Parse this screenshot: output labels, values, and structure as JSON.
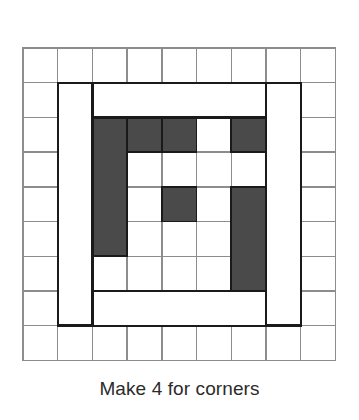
{
  "figure": {
    "caption": "Make 4 for corners"
  },
  "colors": {
    "dark_fabric": "#4a4a4a",
    "light_fabric": "#ffffff",
    "grid_line": "#8d8d8d",
    "outline": "#1a1a1a",
    "background": "#ffffff",
    "caption_text": "#2b2b2b"
  },
  "grid": {
    "columns": 9,
    "rows": 9,
    "cell_size": 34.7,
    "origin_x": 23,
    "origin_y": 48,
    "line_width": 1.4
  },
  "chart_data": {
    "type": "heatmap",
    "xlabel": "",
    "ylabel": "",
    "categories": [
      "c0",
      "c1",
      "c2",
      "c3",
      "c4",
      "c5",
      "c6",
      "c7",
      "c8"
    ],
    "row_labels": [
      "r0",
      "r1",
      "r2",
      "r3",
      "r4",
      "r5",
      "r6",
      "r7",
      "r8"
    ],
    "legend": [
      {
        "name": "dark fabric",
        "color": "#4a4a4a"
      },
      {
        "name": "light fabric",
        "color": "#ffffff"
      }
    ],
    "values": [
      [
        0,
        0,
        0,
        0,
        0,
        0,
        0,
        0,
        0
      ],
      [
        0,
        0,
        0,
        0,
        0,
        0,
        0,
        0,
        0
      ],
      [
        0,
        0,
        1,
        1,
        1,
        0,
        1,
        0,
        0
      ],
      [
        0,
        0,
        1,
        0,
        0,
        0,
        0,
        0,
        0
      ],
      [
        0,
        0,
        1,
        0,
        1,
        0,
        1,
        0,
        0
      ],
      [
        0,
        0,
        1,
        0,
        0,
        0,
        1,
        0,
        0
      ],
      [
        0,
        0,
        0,
        0,
        0,
        0,
        1,
        0,
        0
      ],
      [
        0,
        0,
        1,
        0,
        1,
        1,
        1,
        0,
        0
      ],
      [
        0,
        0,
        0,
        0,
        0,
        0,
        0,
        0,
        0
      ]
    ]
  },
  "patches": {
    "dark_cells": [
      {
        "col": 2,
        "row": 2,
        "w": 1,
        "h": 4
      },
      {
        "col": 3,
        "row": 2,
        "w": 1,
        "h": 1
      },
      {
        "col": 4,
        "row": 2,
        "w": 1,
        "h": 1
      },
      {
        "col": 6,
        "row": 2,
        "w": 1,
        "h": 1
      },
      {
        "col": 4,
        "row": 4,
        "w": 1,
        "h": 1
      },
      {
        "col": 6,
        "row": 4,
        "w": 1,
        "h": 4
      },
      {
        "col": 2,
        "row": 7,
        "w": 1,
        "h": 1
      },
      {
        "col": 4,
        "row": 7,
        "w": 1,
        "h": 1
      },
      {
        "col": 5,
        "row": 7,
        "w": 1,
        "h": 1
      }
    ],
    "light_logs": [
      {
        "name": "left-log",
        "col": 1,
        "row": 1,
        "w": 1,
        "h": 7
      },
      {
        "name": "top-log",
        "col": 2,
        "row": 1,
        "w": 5,
        "h": 1
      },
      {
        "name": "right-log",
        "col": 7,
        "row": 1,
        "w": 1,
        "h": 7
      },
      {
        "name": "bottom-log",
        "col": 2,
        "row": 7,
        "w": 5,
        "h": 1
      }
    ],
    "center_outline": {
      "col": 2,
      "row": 2,
      "w": 5,
      "h": 6
    }
  }
}
